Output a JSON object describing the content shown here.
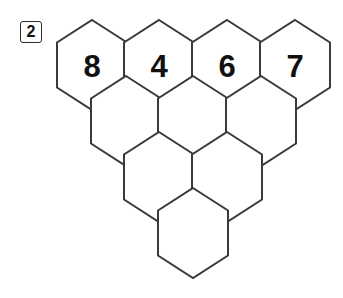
{
  "page": {
    "background_color": "#ffffff",
    "width": 343,
    "height": 298
  },
  "badge": {
    "name": "problem-number",
    "text": "2",
    "border_color": "#2e2e2e",
    "text_color": "#111111"
  },
  "puzzle": {
    "type": "hexagon-pyramid-grid",
    "stroke_color": "#3a3a3a",
    "fill_color": "#ffffff",
    "cell_width": 70,
    "cell_height": 90,
    "orientation": "pointy-top",
    "rows": [
      {
        "row_index": 0,
        "count": 4,
        "center_y": 65,
        "cells": [
          {
            "id": "r0c0",
            "cx": 92,
            "label": "8"
          },
          {
            "id": "r0c1",
            "cx": 159,
            "label": "4"
          },
          {
            "id": "r0c2",
            "cx": 227,
            "label": "6"
          },
          {
            "id": "r0c3",
            "cx": 295,
            "label": "7"
          }
        ]
      },
      {
        "row_index": 1,
        "count": 3,
        "center_y": 121,
        "cells": [
          {
            "id": "r1c0",
            "cx": 126,
            "label": ""
          },
          {
            "id": "r1c1",
            "cx": 193,
            "label": ""
          },
          {
            "id": "r1c2",
            "cx": 261,
            "label": ""
          }
        ]
      },
      {
        "row_index": 2,
        "count": 2,
        "center_y": 177,
        "cells": [
          {
            "id": "r2c0",
            "cx": 159,
            "label": ""
          },
          {
            "id": "r2c1",
            "cx": 227,
            "label": ""
          }
        ]
      },
      {
        "row_index": 3,
        "count": 1,
        "center_y": 233,
        "cells": [
          {
            "id": "r3c0",
            "cx": 193,
            "label": ""
          }
        ]
      }
    ]
  }
}
